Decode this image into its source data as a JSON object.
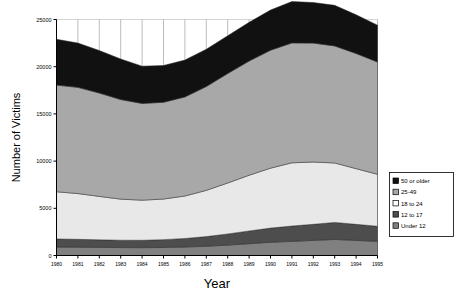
{
  "chart_data": {
    "type": "area",
    "stacked": true,
    "title": "",
    "xlabel": "Year",
    "ylabel": "Number of Victims",
    "x": [
      1980,
      1981,
      1982,
      1983,
      1984,
      1985,
      1986,
      1987,
      1988,
      1989,
      1990,
      1991,
      1992,
      1993,
      1994,
      1995
    ],
    "categories": [
      1980,
      1981,
      1982,
      1983,
      1984,
      1985,
      1986,
      1987,
      1988,
      1989,
      1990,
      1991,
      1992,
      1993,
      1994,
      1995
    ],
    "xtick_labels": [
      "1980",
      "1981",
      "1982",
      "1983",
      "1984",
      "1985",
      "1986",
      "1987",
      "1988",
      "1989",
      "1990",
      "1991",
      "1992",
      "1993",
      "1994",
      "1995"
    ],
    "ytick_labels": [
      "0",
      "5000",
      "10000",
      "15000",
      "20000",
      "25000"
    ],
    "yticks": [
      0,
      5000,
      10000,
      15000,
      20000,
      25000
    ],
    "xlim": [
      1980,
      1995
    ],
    "ylim": [
      0,
      25000
    ],
    "grid": "vertical-and-horizontal-light",
    "legend_position": "right-middle",
    "series": [
      {
        "name": "Under 12",
        "color": "#808080",
        "values": [
          900,
          880,
          860,
          840,
          830,
          850,
          900,
          980,
          1100,
          1250,
          1400,
          1500,
          1600,
          1700,
          1600,
          1500
        ]
      },
      {
        "name": "12 to 17",
        "color": "#4d4d4d",
        "values": [
          850,
          830,
          800,
          780,
          780,
          830,
          900,
          1020,
          1180,
          1350,
          1500,
          1620,
          1700,
          1800,
          1700,
          1600
        ]
      },
      {
        "name": "18 to 24",
        "color": "#e8e8e8",
        "values": [
          5000,
          4850,
          4600,
          4350,
          4250,
          4300,
          4500,
          4900,
          5400,
          5900,
          6350,
          6700,
          6600,
          6300,
          5900,
          5500
        ]
      },
      {
        "name": "25-49",
        "color": "#a8a8a8",
        "values": [
          11300,
          11250,
          10950,
          10550,
          10250,
          10250,
          10500,
          11000,
          11600,
          12100,
          12500,
          12700,
          12600,
          12400,
          12200,
          11900
        ]
      },
      {
        "name": "50 or older",
        "color": "#111111",
        "values": [
          4850,
          4700,
          4500,
          4300,
          3950,
          3900,
          3900,
          3950,
          4000,
          4100,
          4250,
          4380,
          4300,
          4300,
          4100,
          3900
        ]
      }
    ],
    "totals": [
      22900,
      22510,
      21710,
      20820,
      20060,
      20130,
      20700,
      21850,
      23280,
      24700,
      26000,
      26900,
      26800,
      26500,
      25500,
      24400
    ]
  },
  "legend": {
    "items": [
      {
        "label": "50 or older",
        "color": "#111111"
      },
      {
        "label": "25-49",
        "color": "#a8a8a8"
      },
      {
        "label": "18 to 24",
        "color": "#ffffff"
      },
      {
        "label": "12 to 17",
        "color": "#4d4d4d"
      },
      {
        "label": "Under 12",
        "color": "#808080"
      }
    ]
  },
  "axes": {
    "y_title": "Number of Victims",
    "x_title": "Year"
  }
}
